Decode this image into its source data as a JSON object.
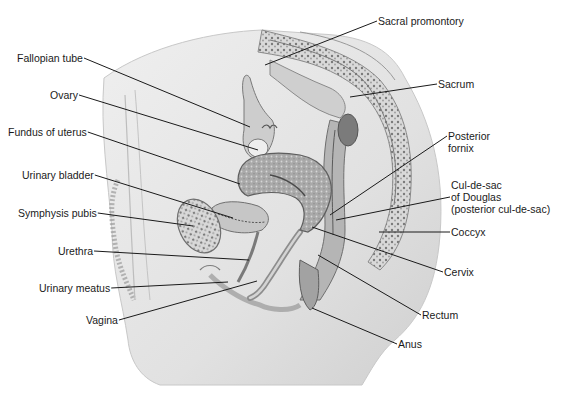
{
  "figure": {
    "colors": {
      "background": "#ffffff",
      "body_fill": "#e3e3e3",
      "tissue_dark": "#8a8a8a",
      "leader_line": "#1a1a1a",
      "text": "#1a1a1a"
    }
  },
  "labels": {
    "left": [
      {
        "id": "fallopian-tube",
        "text": "Fallopian tube",
        "x": 17,
        "y": 58,
        "lx2": 250,
        "ly2": 127
      },
      {
        "id": "ovary",
        "text": "Ovary",
        "x": 50,
        "y": 95,
        "lx2": 258,
        "ly2": 150
      },
      {
        "id": "fundus-of-uterus",
        "text": "Fundus of uterus",
        "x": 8,
        "y": 132,
        "lx2": 240,
        "ly2": 184
      },
      {
        "id": "urinary-bladder",
        "text": "Urinary bladder",
        "x": 22,
        "y": 175,
        "lx2": 233,
        "ly2": 218
      },
      {
        "id": "symphysis-pubis",
        "text": "Symphysis pubis",
        "x": 18,
        "y": 213,
        "lx2": 193,
        "ly2": 226
      },
      {
        "id": "urethra",
        "text": "Urethra",
        "x": 58,
        "y": 251,
        "lx2": 249,
        "ly2": 260
      },
      {
        "id": "urinary-meatus",
        "text": "Urinary meatus",
        "x": 39,
        "y": 288,
        "lx2": 228,
        "ly2": 282
      },
      {
        "id": "vagina",
        "text": "Vagina",
        "x": 86,
        "y": 320,
        "lx2": 257,
        "ly2": 281
      }
    ],
    "right": [
      {
        "id": "sacral-promontory",
        "text": "Sacral promontory",
        "x": 378,
        "y": 15,
        "lx2": 265,
        "ly2": 65
      },
      {
        "id": "sacrum",
        "text": "Sacrum",
        "x": 438,
        "y": 78,
        "lx2": 350,
        "ly2": 97
      },
      {
        "id": "posterior-fornix",
        "text": "Posterior\nfornix",
        "x": 448,
        "y": 130,
        "lx2": 330,
        "ly2": 215
      },
      {
        "id": "cul-de-sac",
        "text": "Cul-de-sac\nof Douglas\n(posterior cul-de-sac)",
        "x": 451,
        "y": 179,
        "lx2": 336,
        "ly2": 220
      },
      {
        "id": "coccyx",
        "text": "Coccyx",
        "x": 451,
        "y": 226,
        "lx2": 379,
        "ly2": 232
      },
      {
        "id": "cervix",
        "text": "Cervix",
        "x": 444,
        "y": 266,
        "lx2": 312,
        "ly2": 227
      },
      {
        "id": "rectum",
        "text": "Rectum",
        "x": 422,
        "y": 309,
        "lx2": 318,
        "ly2": 255
      },
      {
        "id": "anus",
        "text": "Anus",
        "x": 398,
        "y": 338,
        "lx2": 312,
        "ly2": 308
      }
    ]
  }
}
